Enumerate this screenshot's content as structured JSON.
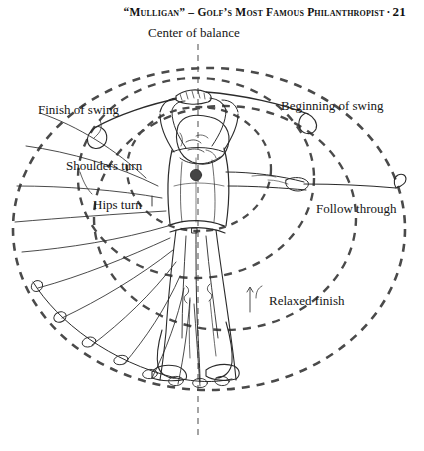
{
  "page": {
    "width": 424,
    "height": 451,
    "background": "#ffffff",
    "ink": "#1a1a1a"
  },
  "running_head": {
    "title": "“Mulligan” – Golf’s Most Famous Philanthropist",
    "separator": "·",
    "page_number": "21"
  },
  "figure": {
    "caption_labels": {
      "center_of_balance": "Center of balance",
      "finish_of_swing": "Finish of swing",
      "beginning_of_swing": "Beginning of swing",
      "shoulders_turn": "Shoulders turn",
      "hips_turn": "Hips turn",
      "follow_through": "Follow through",
      "relaxed_finish": "Relaxed finish"
    },
    "colors": {
      "dashed_circle": "#4a4a4a",
      "line_art": "#2b2b2b",
      "ball": "#454545"
    },
    "geometry": {
      "center_axis_x": 198,
      "axis_top_y": 44,
      "axis_bottom_y": 440,
      "circles": [
        {
          "name": "outer-swing-circle",
          "cx": 209,
          "cy": 229,
          "rx": 196,
          "ry": 161
        },
        {
          "name": "shoulders-turn-circle",
          "cx": 196,
          "cy": 178,
          "rx": 118,
          "ry": 100
        },
        {
          "name": "hips-turn-circle",
          "cx": 199,
          "cy": 169,
          "rx": 72,
          "ry": 62
        },
        {
          "name": "relaxed-finish-circle",
          "cx": 225,
          "cy": 218,
          "rx": 131,
          "ry": 112
        }
      ]
    }
  }
}
